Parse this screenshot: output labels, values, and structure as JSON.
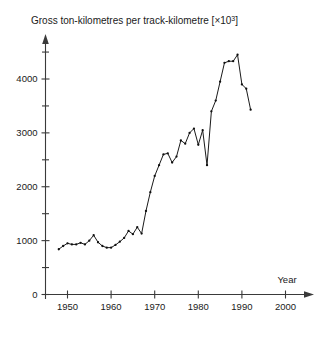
{
  "chart_data": {
    "type": "line",
    "title_main": "Gross ton-kilometres per track-kilometre [×10",
    "title_sup": "3",
    "title_tail": "]",
    "xlabel": "Year",
    "ylabel": "",
    "xlim": [
      1945,
      2005
    ],
    "ylim": [
      0,
      4600
    ],
    "grid": false,
    "legend": "none",
    "marker": "dot",
    "x_ticks": [
      1950,
      1960,
      1970,
      1980,
      1990,
      2000
    ],
    "x_tick_labels": [
      "1950",
      "1960",
      "1970",
      "1980",
      "1990",
      "2000"
    ],
    "y_ticks": [
      0,
      1000,
      2000,
      3000,
      4000
    ],
    "y_tick_labels": [
      "0",
      "1000",
      "2000",
      "3000",
      "4000"
    ],
    "y_minor_ticks": [
      500,
      1500,
      2500,
      3500,
      4500
    ],
    "x": [
      1948,
      1949,
      1950,
      1951,
      1952,
      1953,
      1954,
      1955,
      1956,
      1957,
      1958,
      1959,
      1960,
      1961,
      1962,
      1963,
      1964,
      1965,
      1966,
      1967,
      1968,
      1969,
      1970,
      1971,
      1972,
      1973,
      1974,
      1975,
      1976,
      1977,
      1978,
      1979,
      1980,
      1981,
      1982,
      1983,
      1984,
      1985,
      1986,
      1987,
      1988,
      1989,
      1990,
      1991,
      1992
    ],
    "values": [
      840,
      900,
      950,
      930,
      930,
      960,
      930,
      1000,
      1100,
      970,
      900,
      870,
      870,
      920,
      980,
      1050,
      1180,
      1120,
      1250,
      1130,
      1550,
      1900,
      2200,
      2400,
      2600,
      2620,
      2450,
      2560,
      2860,
      2800,
      3000,
      3080,
      2780,
      3050,
      2400,
      3400,
      3600,
      3950,
      4300,
      4330,
      4330,
      4450,
      3900,
      3820,
      3430
    ],
    "series_name": "Gross ton-kilometres per track-kilometre",
    "line_color": "#1a1a1a",
    "axis_color": "#3a3a3a",
    "background": "#ffffff"
  }
}
